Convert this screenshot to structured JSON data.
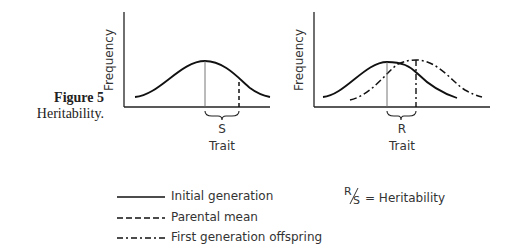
{
  "caption": {
    "figure_label": "Figure 5",
    "title": "Heritability."
  },
  "left_plot": {
    "ylabel": "Frequency",
    "xlabel": "Trait",
    "bracket_label": "S"
  },
  "right_plot": {
    "ylabel": "Frequency",
    "xlabel": "Trait",
    "bracket_label": "R"
  },
  "legend": {
    "items": [
      {
        "style": "solid",
        "label": "Initial generation"
      },
      {
        "style": "dashed",
        "label": "Parental mean"
      },
      {
        "style": "dash-dot",
        "label": "First generation offspring"
      }
    ],
    "formula_numerator": "R",
    "formula_denominator": "S",
    "formula_text": "= Heritability"
  }
}
